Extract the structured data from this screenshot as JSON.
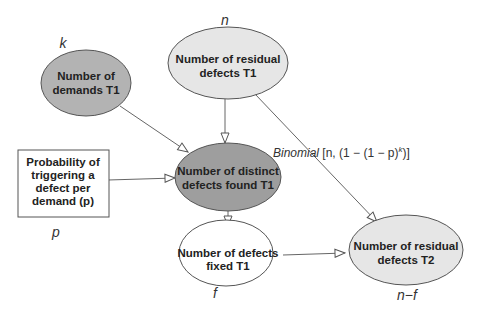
{
  "diagram": {
    "nodes": {
      "demands": {
        "lines": [
          "Number of",
          "demands T1"
        ],
        "variable": "k",
        "fill": "#b3b3b3"
      },
      "residual_t1": {
        "lines": [
          "Number of residual",
          "defects T1"
        ],
        "variable": "n",
        "fill": "#e6e6e6"
      },
      "probability": {
        "lines": [
          "Probability of",
          "triggering a",
          "defect per",
          "demand (p)"
        ],
        "variable": "p",
        "fill": "#ffffff"
      },
      "distinct_found": {
        "lines": [
          "Number of distinct",
          "defects found T1"
        ],
        "fill": "#9e9e9e"
      },
      "fixed": {
        "lines": [
          "Number of defects",
          "fixed T1"
        ],
        "variable": "f",
        "fill": "#ffffff"
      },
      "residual_t2": {
        "lines": [
          "Number of residual",
          "defects T2"
        ],
        "variable": "n−f",
        "fill": "#e6e6e6"
      }
    },
    "edge_label": {
      "italic": "Binomial",
      "rest": " [n, (1 − (1 − p)",
      "superscript": "k",
      "close": ")]"
    },
    "edges": [
      {
        "from": "demands",
        "to": "distinct_found"
      },
      {
        "from": "residual_t1",
        "to": "distinct_found"
      },
      {
        "from": "probability",
        "to": "distinct_found"
      },
      {
        "from": "distinct_found",
        "to": "fixed"
      },
      {
        "from": "residual_t1",
        "to": "residual_t2"
      },
      {
        "from": "fixed",
        "to": "residual_t2"
      }
    ]
  }
}
